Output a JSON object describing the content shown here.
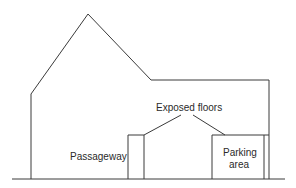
{
  "diagram": {
    "type": "building-elevation-sketch",
    "line_color": "#3a3a3a",
    "background": "#ffffff",
    "labels": {
      "exposed_floors": "Exposed floors",
      "passageway": "Passageway",
      "parking_line1": "Parking",
      "parking_line2": "area"
    }
  }
}
